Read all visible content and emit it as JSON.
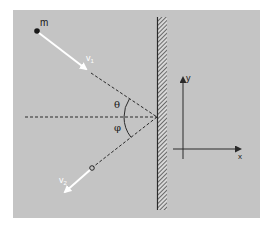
{
  "diagram": {
    "type": "physics-reflection",
    "colors": {
      "page_background": "#ffffff",
      "panel_background": "#c4c4c4",
      "line": "#2a2a2a",
      "velocity_arrow": "#ffffff",
      "wall_hatch": "#3a3a3a"
    },
    "labels": {
      "mass": "m",
      "incoming_velocity": "v",
      "incoming_velocity_sub": "1",
      "outgoing_velocity": "v",
      "outgoing_velocity_sub": "2",
      "angle_incidence": "θ",
      "angle_reflection": "φ",
      "axis_y": "y",
      "axis_x": "x"
    },
    "elements": {
      "mass_point": "particle m",
      "wall": "hatched vertical wall",
      "normal_line": "dashed horizontal normal at impact point",
      "coordinate_axes": "x-y axes"
    }
  }
}
